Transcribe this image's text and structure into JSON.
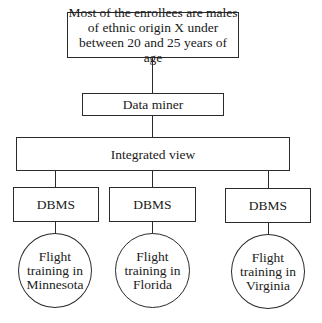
{
  "diagram": {
    "type": "hierarchy",
    "line_color": "#2a2a2a",
    "result_box": {
      "lines": [
        "Most of the enrollees are males",
        "of ethnic origin X under",
        "between 20 and 25 years of age"
      ]
    },
    "data_miner": {
      "label": "Data miner"
    },
    "integrated_view": {
      "label": "Integrated view"
    },
    "dbms_nodes": [
      {
        "label": "DBMS",
        "source": {
          "lines": [
            "Flight",
            "training in",
            "Minnesota"
          ]
        }
      },
      {
        "label": "DBMS",
        "source": {
          "lines": [
            "Flight",
            "training in",
            "Florida"
          ]
        }
      },
      {
        "label": "DBMS",
        "source": {
          "lines": [
            "Flight",
            "training in",
            "Virginia"
          ]
        }
      }
    ]
  }
}
